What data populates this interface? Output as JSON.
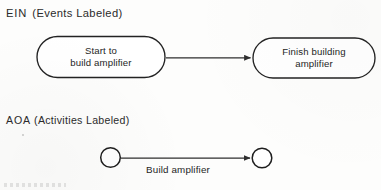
{
  "figure": {
    "background_color": "#fdfdfc",
    "ink_color": "#252525"
  },
  "sections": [
    {
      "id": "ein",
      "code": "EIN",
      "qualifier": "(Events Labeled)"
    },
    {
      "id": "aoa",
      "code": "AOA",
      "qualifier": "(Activities Labeled)"
    }
  ],
  "ein_diagram": {
    "nodes": [
      {
        "id": "start-node",
        "shape": "rounded-rectangle",
        "line1": "Start to",
        "line2": "build amplifier"
      },
      {
        "id": "finish-node",
        "shape": "rounded-rectangle",
        "line1": "Finish building",
        "line2": "amplifier"
      }
    ],
    "edges": [
      {
        "id": "start-to-finish",
        "from": "start-node",
        "to": "finish-node",
        "label": "",
        "arrowhead": "filled-triangle"
      }
    ]
  },
  "aoa_diagram": {
    "nodes": [
      {
        "id": "left-event-node",
        "shape": "circle",
        "label": ""
      },
      {
        "id": "right-event-node",
        "shape": "circle",
        "label": ""
      }
    ],
    "edges": [
      {
        "id": "build-amplifier-activity",
        "from": "left-event-node",
        "to": "right-event-node",
        "label": "Build amplifier",
        "arrowhead": "filled-triangle"
      }
    ]
  }
}
